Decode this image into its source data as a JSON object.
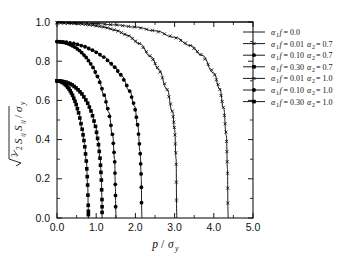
{
  "figure": {
    "background": "#ffffff",
    "foreground": "#000000"
  },
  "chart_data": {
    "type": "line",
    "title": "",
    "xlabel": "p / σᵧ",
    "ylabel": "√(3/2 Sᵢⱼ Sᵢⱼ) / σᵧ",
    "xlim": [
      0.0,
      5.0
    ],
    "ylim": [
      0.0,
      1.0
    ],
    "xticks": [
      "0.0",
      "1.0",
      "2.0",
      "3.0",
      "4.0",
      "5.0"
    ],
    "xtick_values": [
      0.0,
      1.0,
      2.0,
      3.0,
      4.0,
      5.0
    ],
    "yticks": [
      "0.0",
      "0.2",
      "0.4",
      "0.6",
      "0.8",
      "1.0"
    ],
    "ytick_values": [
      0.0,
      0.2,
      0.4,
      0.6,
      0.8,
      1.0
    ],
    "minor_ticks": true,
    "grid": false,
    "legend_position": "right-top",
    "series": [
      {
        "name": "α₁f = 0.0",
        "label_parts": {
          "alpha1f": "0.0",
          "alpha2": ""
        },
        "marker": "none",
        "y0": 1.0,
        "x_end": 5.0,
        "points": [
          [
            0.0,
            1.0
          ],
          [
            5.0,
            1.0
          ]
        ]
      },
      {
        "name": "α₁f = 0.01 α₂ = 0.7",
        "label_parts": {
          "alpha1f": "0.01",
          "alpha2": "0.7"
        },
        "marker": "cross",
        "y0": 0.995,
        "x_end": 3.05,
        "points": [
          [
            0.0,
            0.995
          ],
          [
            0.3,
            0.993
          ],
          [
            0.6,
            0.99
          ],
          [
            0.9,
            0.984
          ],
          [
            1.2,
            0.974
          ],
          [
            1.5,
            0.958
          ],
          [
            1.8,
            0.932
          ],
          [
            2.1,
            0.89
          ],
          [
            2.4,
            0.822
          ],
          [
            2.6,
            0.757
          ],
          [
            2.8,
            0.66
          ],
          [
            2.95,
            0.54
          ],
          [
            3.0,
            0.45
          ],
          [
            3.04,
            0.3
          ],
          [
            3.05,
            0.0
          ]
        ]
      },
      {
        "name": "α₁f = 0.10 α₂ = 0.7",
        "label_parts": {
          "alpha1f": "0.10",
          "alpha2": "0.7"
        },
        "marker": "circle",
        "y0": 0.9,
        "x_end": 1.5,
        "points": [
          [
            0.0,
            0.9
          ],
          [
            0.15,
            0.897
          ],
          [
            0.3,
            0.888
          ],
          [
            0.45,
            0.873
          ],
          [
            0.6,
            0.85
          ],
          [
            0.75,
            0.818
          ],
          [
            0.9,
            0.775
          ],
          [
            1.05,
            0.715
          ],
          [
            1.2,
            0.63
          ],
          [
            1.32,
            0.54
          ],
          [
            1.42,
            0.42
          ],
          [
            1.47,
            0.3
          ],
          [
            1.49,
            0.15
          ],
          [
            1.5,
            0.0
          ]
        ]
      },
      {
        "name": "α₁f = 0.30 α₂ = 0.7",
        "label_parts": {
          "alpha1f": "0.30",
          "alpha2": "0.7"
        },
        "marker": "square",
        "y0": 0.7,
        "x_end": 0.8,
        "points": [
          [
            0.0,
            0.7
          ],
          [
            0.08,
            0.698
          ],
          [
            0.16,
            0.69
          ],
          [
            0.24,
            0.676
          ],
          [
            0.32,
            0.655
          ],
          [
            0.4,
            0.625
          ],
          [
            0.48,
            0.585
          ],
          [
            0.56,
            0.53
          ],
          [
            0.64,
            0.455
          ],
          [
            0.7,
            0.38
          ],
          [
            0.75,
            0.285
          ],
          [
            0.78,
            0.18
          ],
          [
            0.8,
            0.045
          ],
          [
            0.8,
            0.0
          ]
        ]
      },
      {
        "name": "α₁f = 0.01 α₂ = 1.0",
        "label_parts": {
          "alpha1f": "0.01",
          "alpha2": "1.0"
        },
        "marker": "cross",
        "y0": 0.998,
        "x_end": 4.35,
        "points": [
          [
            0.0,
            0.998
          ],
          [
            0.5,
            0.996
          ],
          [
            1.0,
            0.992
          ],
          [
            1.5,
            0.985
          ],
          [
            2.0,
            0.974
          ],
          [
            2.5,
            0.955
          ],
          [
            3.0,
            0.922
          ],
          [
            3.4,
            0.88
          ],
          [
            3.7,
            0.83
          ],
          [
            4.0,
            0.74
          ],
          [
            4.15,
            0.66
          ],
          [
            4.25,
            0.56
          ],
          [
            4.32,
            0.42
          ],
          [
            4.35,
            0.25
          ],
          [
            4.36,
            0.0
          ]
        ]
      },
      {
        "name": "α₁f = 0.10 α₂ = 1.0",
        "label_parts": {
          "alpha1f": "0.10",
          "alpha2": "1.0"
        },
        "marker": "circle",
        "y0": 0.9,
        "x_end": 2.15,
        "points": [
          [
            0.0,
            0.9
          ],
          [
            0.2,
            0.898
          ],
          [
            0.45,
            0.89
          ],
          [
            0.7,
            0.875
          ],
          [
            0.95,
            0.852
          ],
          [
            1.2,
            0.82
          ],
          [
            1.45,
            0.775
          ],
          [
            1.65,
            0.725
          ],
          [
            1.85,
            0.65
          ],
          [
            1.98,
            0.57
          ],
          [
            2.06,
            0.47
          ],
          [
            2.12,
            0.34
          ],
          [
            2.15,
            0.205
          ],
          [
            2.16,
            0.0
          ]
        ]
      },
      {
        "name": "α₁f = 0.30 α₂ = 1.0",
        "label_parts": {
          "alpha1f": "0.30",
          "alpha2": "1.0"
        },
        "marker": "square",
        "y0": 0.7,
        "x_end": 1.15,
        "points": [
          [
            0.0,
            0.7
          ],
          [
            0.12,
            0.698
          ],
          [
            0.25,
            0.692
          ],
          [
            0.38,
            0.68
          ],
          [
            0.51,
            0.66
          ],
          [
            0.64,
            0.632
          ],
          [
            0.77,
            0.592
          ],
          [
            0.88,
            0.54
          ],
          [
            0.98,
            0.47
          ],
          [
            1.05,
            0.39
          ],
          [
            1.1,
            0.3
          ],
          [
            1.13,
            0.205
          ],
          [
            1.15,
            0.075
          ],
          [
            1.15,
            0.0
          ]
        ]
      }
    ]
  },
  "legend": {
    "entries": [
      {
        "marker": "line",
        "text": "α₁f = 0.0"
      },
      {
        "marker": "cross",
        "text": "α₁f = 0.01  α₂ = 0.7"
      },
      {
        "marker": "circle",
        "text": "α₁f = 0.10  α₂ = 0.7"
      },
      {
        "marker": "square",
        "text": "α₁f = 0.30  α₂ = 0.7"
      },
      {
        "marker": "cross",
        "text": "α₁f = 0.01  α₂ = 1.0"
      },
      {
        "marker": "circle",
        "text": "α₁f = 0.10  α₂ = 1.0"
      },
      {
        "marker": "square",
        "text": "α₁f = 0.30  α₂ = 1.0"
      }
    ]
  },
  "axis": {
    "x_label_text": "p / σy",
    "y_label_text": "√3/2 SijSij / σy"
  }
}
